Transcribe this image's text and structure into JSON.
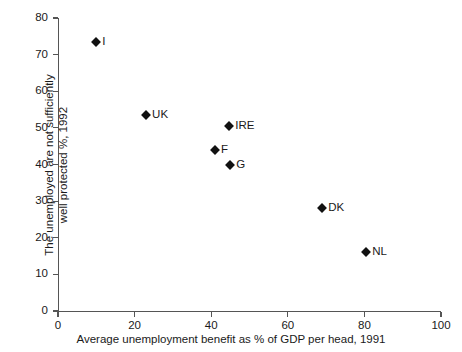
{
  "chart_data": {
    "type": "scatter",
    "title": "",
    "xlabel": "Average unemployment benefit as % of GDP per head, 1991",
    "ylabel_line1": "The unemployed are not  sufficiently",
    "ylabel_line2": "well protected %, 1992",
    "xlim": [
      0,
      100
    ],
    "ylim": [
      0,
      80
    ],
    "xticks": [
      0,
      20,
      40,
      60,
      80,
      100
    ],
    "yticks": [
      0,
      10,
      20,
      30,
      40,
      50,
      60,
      70,
      80
    ],
    "xtick_labels": [
      "0",
      "20",
      "40",
      "60",
      "80",
      "100"
    ],
    "ytick_labels": [
      "0",
      "10",
      "20",
      "30",
      "40",
      "50",
      "60",
      "70",
      "80"
    ],
    "grid": false,
    "legend": "none",
    "marker": "diamond",
    "marker_color": "#111111",
    "points": [
      {
        "label": "I",
        "x": 10.0,
        "y": 73.5,
        "label_side": "right"
      },
      {
        "label": "UK",
        "x": 23.0,
        "y": 53.5,
        "label_side": "right"
      },
      {
        "label": "IRE",
        "x": 44.7,
        "y": 50.5,
        "label_side": "right"
      },
      {
        "label": "F",
        "x": 41.0,
        "y": 44.0,
        "label_side": "right"
      },
      {
        "label": "G",
        "x": 45.0,
        "y": 40.0,
        "label_side": "right"
      },
      {
        "label": "DK",
        "x": 69.0,
        "y": 28.0,
        "label_side": "right"
      },
      {
        "label": "NL",
        "x": 80.5,
        "y": 16.0,
        "label_side": "right"
      }
    ]
  },
  "axes": {
    "x_axis_label": "Average unemployment benefit as % of GDP per head, 1991",
    "y_axis_label_line1": "The unemployed are not  sufficiently",
    "y_axis_label_line2": "well protected %, 1992"
  }
}
